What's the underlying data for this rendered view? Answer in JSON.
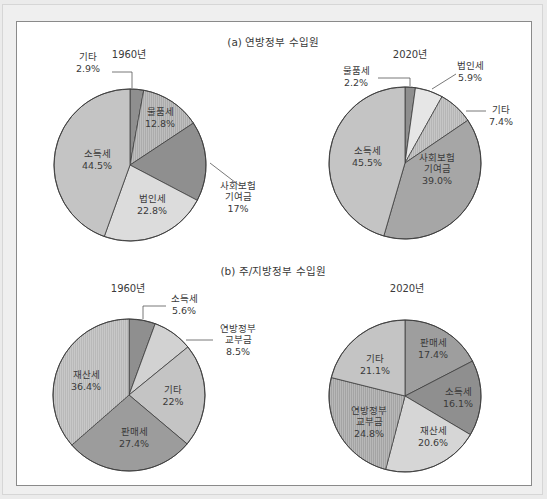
{
  "figure": {
    "section_a_title": "(a) 연방정부 수입원",
    "section_b_title": "(b) 주/지방정부 수입원"
  },
  "colors": {
    "slice_dark": "#8f8f8f",
    "slice_mid": "#a9a9a9",
    "slice_light": "#c9c9c9",
    "slice_lighter": "#dcdcdc",
    "slice_lightest": "#e6e6e6",
    "outline": "#3c3c3c",
    "leader": "#555555"
  },
  "chart_data": [
    {
      "type": "pie",
      "section": "(a) 연방정부 수입원",
      "title": "1960년",
      "center": [
        130,
        165
      ],
      "radius": 76,
      "title_pos": [
        129,
        58
      ],
      "slices": [
        {
          "label": "기타",
          "value": 2.9,
          "value_label": "2.9%",
          "color": "#8f8f8f",
          "label_lines": [
            "기타",
            "2.9%"
          ],
          "label_pos": [
            88,
            62
          ],
          "leader": [
            [
              112,
              72
            ],
            [
              132,
              72
            ],
            [
              132,
              88
            ]
          ]
        },
        {
          "label": "물품세",
          "value": 12.8,
          "value_label": "12.8%",
          "color": "#acacac",
          "hatch": true,
          "label_lines": [
            "물품세",
            "12.8%"
          ],
          "label_pos": [
            160,
            117
          ]
        },
        {
          "label": "사회보험 기여금",
          "value": 17,
          "value_label": "17%",
          "color": "#8f8f8f",
          "label_lines": [
            "사회보험",
            "기여금",
            "17%"
          ],
          "label_pos": [
            238,
            196
          ],
          "leader": [
            [
              210,
              163
            ],
            [
              240,
              186
            ]
          ]
        },
        {
          "label": "법인세",
          "value": 22.8,
          "value_label": "22.8%",
          "color": "#dcdcdc",
          "label_lines": [
            "법인세",
            "22.8%"
          ],
          "label_pos": [
            152,
            204
          ]
        },
        {
          "label": "소득세",
          "value": 44.5,
          "value_label": "44.5%",
          "color": "#c4c4c4",
          "label_lines": [
            "소득세",
            "44.5%"
          ],
          "label_pos": [
            97,
            159
          ]
        }
      ]
    },
    {
      "type": "pie",
      "section": "(a) 연방정부 수입원",
      "title": "2020년",
      "center": [
        405,
        163
      ],
      "radius": 76,
      "title_pos": [
        410,
        58
      ],
      "slices": [
        {
          "label": "물품세",
          "value": 2.2,
          "value_label": "2.2%",
          "color": "#8f8f8f",
          "label_lines": [
            "물품세",
            "2.2%"
          ],
          "label_pos": [
            356,
            76
          ],
          "leader": [
            [
              378,
              78
            ],
            [
              410,
              78
            ],
            [
              410,
              86
            ]
          ]
        },
        {
          "label": "법인세",
          "value": 5.9,
          "value_label": "5.9%",
          "color": "#e6e6e6",
          "label_lines": [
            "법인세",
            "5.9%"
          ],
          "label_pos": [
            470,
            71
          ],
          "leader": [
            [
              432,
              89
            ],
            [
              456,
              74
            ]
          ]
        },
        {
          "label": "기타",
          "value": 7.4,
          "value_label": "7.4%",
          "color": "#b6b6b6",
          "hatch": true,
          "label_lines": [
            "기타",
            "7.4%"
          ],
          "label_pos": [
            501,
            115
          ],
          "leader": [
            [
              466,
              111
            ],
            [
              486,
              111
            ]
          ]
        },
        {
          "label": "사회보험 기여금",
          "value": 39.0,
          "value_label": "39.0%",
          "color": "#a6a6a6",
          "label_lines": [
            "사회보험",
            "기여금",
            "39.0%"
          ],
          "label_pos": [
            437,
            168
          ]
        },
        {
          "label": "소득세",
          "value": 45.5,
          "value_label": "45.5%",
          "color": "#c4c4c4",
          "label_lines": [
            "소득세",
            "45.5%"
          ],
          "label_pos": [
            367,
            156
          ]
        }
      ]
    },
    {
      "type": "pie",
      "section": "(b) 주/지방정부 수입원",
      "title": "1960년",
      "center": [
        129,
        395
      ],
      "radius": 76,
      "title_pos": [
        128,
        292
      ],
      "slices": [
        {
          "label": "소득세",
          "value": 5.6,
          "value_label": "5.6%",
          "color": "#8f8f8f",
          "label_lines": [
            "소득세",
            "5.6%"
          ],
          "label_pos": [
            184,
            304
          ],
          "leader": [
            [
              143,
              319
            ],
            [
              143,
              306
            ],
            [
              166,
              306
            ]
          ]
        },
        {
          "label": "연방정부 교부금",
          "value": 8.5,
          "value_label": "8.5%",
          "color": "#d2d2d2",
          "label_lines": [
            "연방정부",
            "교부금",
            "8.5%"
          ],
          "label_pos": [
            238,
            339
          ],
          "leader": [
            [
              186,
              340
            ],
            [
              213,
              340
            ]
          ]
        },
        {
          "label": "기타",
          "value": 22,
          "value_label": "22%",
          "color": "#c4c4c4",
          "label_lines": [
            "기타",
            "22%"
          ],
          "label_pos": [
            173,
            395
          ]
        },
        {
          "label": "판매세",
          "value": 27.4,
          "value_label": "27.4%",
          "color": "#9c9c9c",
          "label_lines": [
            "판매세",
            "27.4%"
          ],
          "label_pos": [
            134,
            437
          ]
        },
        {
          "label": "재산세",
          "value": 36.4,
          "value_label": "36.4%",
          "color": "#b9b9b9",
          "hatch": true,
          "label_lines": [
            "재산세",
            "36.4%"
          ],
          "label_pos": [
            86,
            380
          ]
        }
      ]
    },
    {
      "type": "pie",
      "section": "(b) 주/지방정부 수입원",
      "title": "2020년",
      "center": [
        405,
        396
      ],
      "radius": 76,
      "title_pos": [
        407,
        292
      ],
      "slices": [
        {
          "label": "판매세",
          "value": 17.4,
          "value_label": "17.4%",
          "color": "#9e9e9e",
          "label_lines": [
            "판매세",
            "17.4%"
          ],
          "label_pos": [
            433,
            348
          ]
        },
        {
          "label": "소득세",
          "value": 16.1,
          "value_label": "16.1%",
          "color": "#8f8f8f",
          "label_lines": [
            "소득세",
            "16.1%"
          ],
          "label_pos": [
            458,
            397
          ]
        },
        {
          "label": "재산세",
          "value": 20.6,
          "value_label": "20.6%",
          "color": "#d6d6d6",
          "label_lines": [
            "재산세",
            "20.6%"
          ],
          "label_pos": [
            433,
            436
          ]
        },
        {
          "label": "연방정부 교부금",
          "value": 24.8,
          "value_label": "24.8%",
          "color": "#a4a4a4",
          "hatch": true,
          "label_lines": [
            "연방정부",
            "교부금",
            "24.8%"
          ],
          "label_pos": [
            369,
            421
          ]
        },
        {
          "label": "기타",
          "value": 21.1,
          "value_label": "21.1%",
          "color": "#c4c4c4",
          "label_lines": [
            "기타",
            "21.1%"
          ],
          "label_pos": [
            375,
            364
          ]
        }
      ]
    }
  ]
}
